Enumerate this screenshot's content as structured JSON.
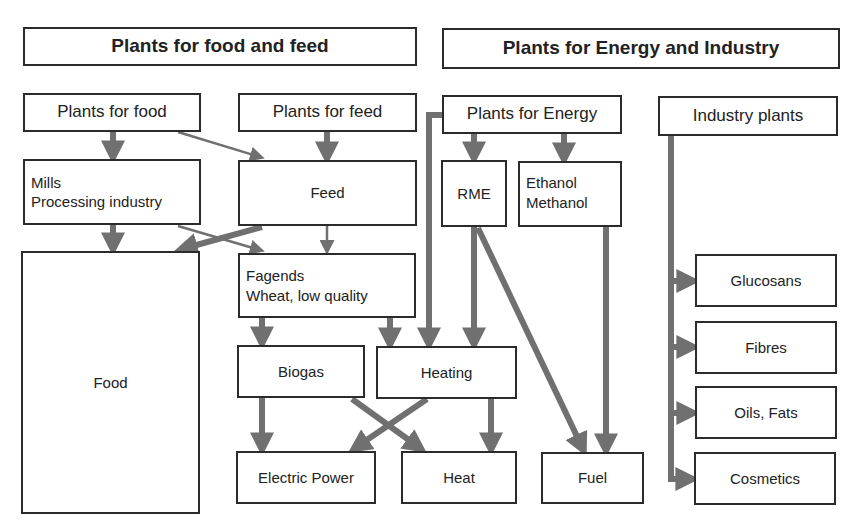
{
  "headers": {
    "food_feed": "Plants for food and feed",
    "energy_industry": "Plants for Energy and Industry"
  },
  "nodes": {
    "plants_for_food": "Plants for food",
    "plants_for_feed": "Plants for feed",
    "plants_for_energy": "Plants for Energy",
    "industry_plants": "Industry plants",
    "mills": "Mills\nProcessing industry",
    "feed": "Feed",
    "rme": "RME",
    "ethanol_methanol": "Ethanol\nMethanol",
    "food": "Food",
    "fagends": "Fagends\nWheat, low quality",
    "glucosans": "Glucosans",
    "fibres": "Fibres",
    "oils_fats": "Oils, Fats",
    "cosmetics": "Cosmetics",
    "biogas": "Biogas",
    "heating": "Heating",
    "electric_power": "Electric Power",
    "heat": "Heat",
    "fuel": "Fuel"
  },
  "colors": {
    "arrow": "#707070",
    "border": "#2b2b2b"
  },
  "edges": [
    {
      "from": "Plants for food",
      "to": "Mills Processing industry"
    },
    {
      "from": "Plants for food",
      "to": "Feed"
    },
    {
      "from": "Plants for feed",
      "to": "Feed"
    },
    {
      "from": "Mills Processing industry",
      "to": "Food"
    },
    {
      "from": "Mills Processing industry",
      "to": "Fagends"
    },
    {
      "from": "Feed",
      "to": "Food"
    },
    {
      "from": "Feed",
      "to": "Fagends"
    },
    {
      "from": "Fagends",
      "to": "Biogas"
    },
    {
      "from": "Fagends",
      "to": "Heating"
    },
    {
      "from": "Plants for Energy",
      "to": "Heating"
    },
    {
      "from": "Plants for Energy",
      "to": "RME"
    },
    {
      "from": "Plants for Energy",
      "to": "Ethanol Methanol"
    },
    {
      "from": "RME",
      "to": "Heating"
    },
    {
      "from": "RME",
      "to": "Fuel"
    },
    {
      "from": "Ethanol Methanol",
      "to": "Fuel"
    },
    {
      "from": "Biogas",
      "to": "Electric Power"
    },
    {
      "from": "Biogas",
      "to": "Heat"
    },
    {
      "from": "Heating",
      "to": "Electric Power"
    },
    {
      "from": "Heating",
      "to": "Heat"
    },
    {
      "from": "Industry plants",
      "to": "Glucosans"
    },
    {
      "from": "Industry plants",
      "to": "Fibres"
    },
    {
      "from": "Industry plants",
      "to": "Oils, Fats"
    },
    {
      "from": "Industry plants",
      "to": "Cosmetics"
    }
  ]
}
